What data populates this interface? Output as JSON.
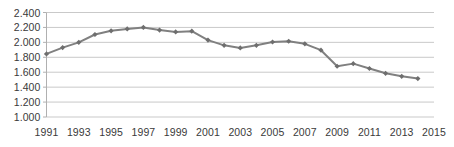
{
  "chart_data": {
    "type": "line",
    "title": "",
    "subtitle": "",
    "xlabel": "",
    "ylabel": "",
    "x": [
      1991,
      1992,
      1993,
      1994,
      1995,
      1996,
      1997,
      1998,
      1999,
      2000,
      2001,
      2002,
      2003,
      2004,
      2005,
      2006,
      2007,
      2008,
      2009,
      2010,
      2011,
      2012,
      2013,
      2014
    ],
    "values": [
      1845,
      1930,
      2000,
      2105,
      2155,
      2180,
      2200,
      2165,
      2140,
      2150,
      2030,
      1960,
      1925,
      1960,
      2005,
      2015,
      1980,
      1895,
      1680,
      1715,
      1650,
      1585,
      1545,
      1515
    ],
    "series": [
      {
        "name": "series-1",
        "values": [
          1845,
          1930,
          2000,
          2105,
          2155,
          2180,
          2200,
          2165,
          2140,
          2150,
          2030,
          1960,
          1925,
          1960,
          2005,
          2015,
          1980,
          1895,
          1680,
          1715,
          1650,
          1585,
          1545,
          1515
        ]
      }
    ],
    "xlim": [
      1991,
      2015
    ],
    "ylim": [
      1000,
      2400
    ],
    "y_ticks": [
      1000,
      1200,
      1400,
      1600,
      1800,
      2000,
      2200,
      2400
    ],
    "y_tick_labels": [
      "1.000",
      "1.200",
      "1.400",
      "1.600",
      "1.800",
      "2.000",
      "2.200",
      "2.400"
    ],
    "x_ticks": [
      1991,
      1993,
      1995,
      1997,
      1999,
      2001,
      2003,
      2005,
      2007,
      2009,
      2011,
      2013,
      2015
    ],
    "x_tick_labels": [
      "1991",
      "1993",
      "1995",
      "1997",
      "1999",
      "2001",
      "2003",
      "2005",
      "2007",
      "2009",
      "2011",
      "2013",
      "2015"
    ],
    "grid": true,
    "grid_axis": "y",
    "legend": false,
    "legend_position": "none",
    "marker": "diamond",
    "annotations": [],
    "colors": {
      "line": "#808080",
      "marker": "#6e6e6e",
      "grid": "#c9c9c9",
      "axis": "#b0b0b0",
      "tick_text": "#3a3a3a",
      "background": "#ffffff"
    }
  }
}
